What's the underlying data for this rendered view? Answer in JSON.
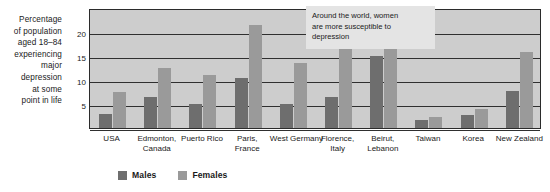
{
  "chart_data": {
    "type": "bar",
    "title": "",
    "xlabel": "",
    "ylabel": "Percentage of population aged 18–84 experiencing major depression at some point in life",
    "ylabel_lines": [
      "Percentage",
      "of population",
      "aged 18–84",
      "experiencing",
      "major",
      "depression",
      "at some",
      "point in life"
    ],
    "ylim": [
      0,
      25
    ],
    "yticks": [
      0,
      5,
      10,
      15,
      20
    ],
    "ytick_labels": [
      "",
      "5",
      "10",
      "15",
      "20"
    ],
    "grid": true,
    "legend_position": "bottom-left",
    "categories": [
      "USA",
      "Edmonton, Canada",
      "Puerto Rico",
      "Paris, France",
      "West Germany",
      "Florence, Italy",
      "Beirut, Lebanon",
      "Taiwan",
      "Korea",
      "New Zealand"
    ],
    "category_label_lines": [
      [
        "USA"
      ],
      [
        "Edmonton,",
        "Canada"
      ],
      [
        "Puerto Rico"
      ],
      [
        "Paris,",
        "France"
      ],
      [
        "West Germany"
      ],
      [
        "Florence,",
        "Italy"
      ],
      [
        "Beirut,",
        "Lebanon"
      ],
      [
        "Taiwan"
      ],
      [
        "Korea"
      ],
      [
        "New Zealand"
      ]
    ],
    "series": [
      {
        "name": "Males",
        "color": "#6e6e6e",
        "values": [
          3.0,
          6.5,
          5.0,
          10.5,
          5.0,
          6.5,
          15.0,
          1.7,
          2.7,
          7.8
        ]
      },
      {
        "name": "Females",
        "color": "#9a9a9a",
        "values": [
          7.5,
          12.5,
          11.0,
          21.5,
          13.5,
          18.0,
          23.0,
          2.2,
          4.0,
          15.8
        ]
      }
    ],
    "annotations": [
      {
        "text": "Around the world, women are more susceptible to depression",
        "lines": [
          "Around the world, women",
          "are more susceptible to",
          "depression"
        ]
      }
    ]
  },
  "legend": {
    "items": [
      {
        "label": "Males",
        "color": "#6e6e6e"
      },
      {
        "label": "Females",
        "color": "#9a9a9a"
      }
    ]
  },
  "colors": {
    "plot_background": "#cdcdcd",
    "axis": "#2b2b2b",
    "gridline": "#2f2f2f",
    "annotation_background": "#e4e4e4",
    "text": "#1a1a1a"
  }
}
